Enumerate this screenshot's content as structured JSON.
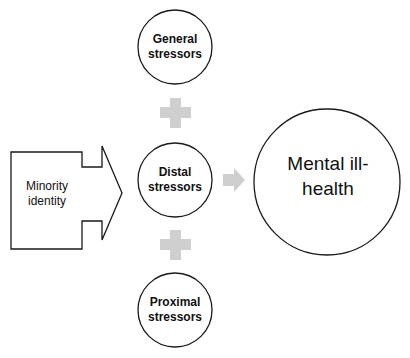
{
  "diagram": {
    "type": "minority-stress-model",
    "nodes": {
      "minority_identity": {
        "label": "Minority identity",
        "shape": "box-with-arrow"
      },
      "general_stressors": {
        "label": "General stressors",
        "shape": "circle"
      },
      "distal_stressors": {
        "label": "Distal stressors",
        "shape": "circle"
      },
      "proximal_stressors": {
        "label": "Proximal stressors",
        "shape": "circle"
      },
      "mental_ill_health": {
        "label": "Mental ill-health",
        "shape": "large-circle"
      }
    },
    "connectors": [
      {
        "from": "minority_identity",
        "to": "distal_stressors",
        "symbol": "outline-arrow"
      },
      {
        "from": "general_stressors",
        "to": "distal_stressors",
        "symbol": "plus"
      },
      {
        "from": "distal_stressors",
        "to": "proximal_stressors",
        "symbol": "plus"
      },
      {
        "from": "distal_stressors",
        "to": "mental_ill_health",
        "symbol": "gray-arrow"
      }
    ],
    "colors": {
      "stroke": "#1a1a1a",
      "connector_gray": "#cfcfcf",
      "background": "#ffffff"
    }
  }
}
